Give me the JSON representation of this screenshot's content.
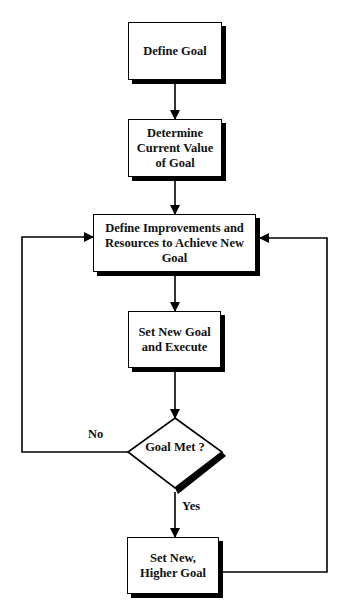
{
  "diagram": {
    "type": "flowchart",
    "nodes": [
      {
        "id": "define-goal",
        "shape": "rect",
        "label": "Define Goal"
      },
      {
        "id": "determine-current",
        "shape": "rect",
        "label": "Determine\nCurrent Value\nof Goal"
      },
      {
        "id": "define-improvements",
        "shape": "rect",
        "label": "Define Improvements and\nResources to Achieve New\nGoal"
      },
      {
        "id": "set-new-goal",
        "shape": "rect",
        "label": "Set New Goal\nand Execute"
      },
      {
        "id": "goal-met",
        "shape": "diamond",
        "label": "Goal Met ?"
      },
      {
        "id": "set-higher-goal",
        "shape": "rect",
        "label": "Set New,\nHigher Goal"
      }
    ],
    "edges": [
      {
        "from": "define-goal",
        "to": "determine-current",
        "label": ""
      },
      {
        "from": "determine-current",
        "to": "define-improvements",
        "label": ""
      },
      {
        "from": "define-improvements",
        "to": "set-new-goal",
        "label": ""
      },
      {
        "from": "set-new-goal",
        "to": "goal-met",
        "label": ""
      },
      {
        "from": "goal-met",
        "to": "define-improvements",
        "label": "No"
      },
      {
        "from": "goal-met",
        "to": "set-higher-goal",
        "label": "Yes"
      },
      {
        "from": "set-higher-goal",
        "to": "define-improvements",
        "label": ""
      }
    ],
    "edge_labels": {
      "no": "No",
      "yes": "Yes"
    },
    "colors": {
      "stroke": "#000000",
      "fill": "#ffffff",
      "text": "#111111"
    }
  }
}
